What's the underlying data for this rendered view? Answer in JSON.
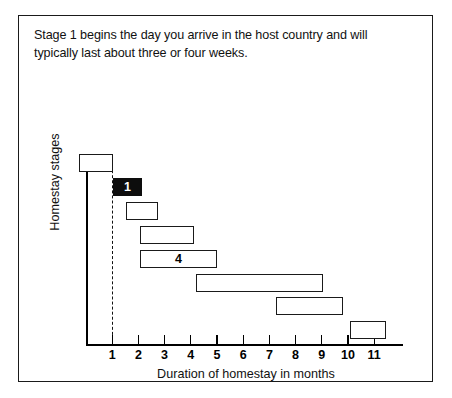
{
  "figure": {
    "caption": "Stage 1 begins the day you arrive in the host country and will typically last about three or four weeks."
  },
  "chart_data": {
    "type": "bar",
    "orientation": "horizontal",
    "subtype": "gantt-range-bars",
    "title": "",
    "xlabel": "Duration of homestay in months",
    "ylabel": "Homestay stages",
    "xlim": [
      0,
      12.1
    ],
    "xticks": [
      1,
      2,
      3,
      4,
      5,
      6,
      7,
      8,
      9,
      10,
      11
    ],
    "xtick_labels": [
      "1",
      "2",
      "3",
      "4",
      "5",
      "6",
      "7",
      "8",
      "9",
      "10",
      "11"
    ],
    "grid": false,
    "legend": "none",
    "annotations": [
      {
        "name": "stage-1-boundary",
        "type": "vertical-dashed-line",
        "x": 1.0
      }
    ],
    "categories": [
      "stage-0",
      "stage-1",
      "stage-2",
      "stage-3",
      "stage-4",
      "stage-5",
      "stage-6",
      "stage-7"
    ],
    "bars": [
      {
        "index": 0,
        "start": -0.27,
        "end": 1.03,
        "label": "",
        "filled": false
      },
      {
        "index": 1,
        "start": 1.03,
        "end": 2.14,
        "label": "1",
        "filled": true
      },
      {
        "index": 2,
        "start": 1.53,
        "end": 2.76,
        "label": "",
        "filled": false
      },
      {
        "index": 3,
        "start": 2.06,
        "end": 4.12,
        "label": "",
        "filled": false
      },
      {
        "index": 4,
        "start": 2.06,
        "end": 5.0,
        "label": "4",
        "filled": false
      },
      {
        "index": 5,
        "start": 4.2,
        "end": 9.03,
        "label": "",
        "filled": false
      },
      {
        "index": 6,
        "start": 7.26,
        "end": 9.8,
        "label": "",
        "filled": false
      },
      {
        "index": 7,
        "start": 10.07,
        "end": 11.45,
        "label": "",
        "filled": false
      }
    ]
  },
  "colors": {
    "frame": "#1a1a1a",
    "axis": "#000000",
    "bar_outline": "#1a1a1a",
    "bar_fill_empty": "#ffffff",
    "bar_fill_highlight": "#0d0d0d",
    "text": "#111111"
  }
}
